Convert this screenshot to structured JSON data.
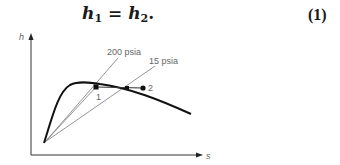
{
  "equation": {
    "lhs_var": "h",
    "lhs_sub": "1",
    "operator": "=",
    "rhs_var": "h",
    "rhs_sub": "2",
    "trailing": ".",
    "number": "(1)"
  },
  "diagram": {
    "y_axis_label": "h",
    "x_axis_label": "s",
    "isobar_high_label": "200 psia",
    "isobar_low_label": "15 psia",
    "state_1_label": "1",
    "state_2_label": "2",
    "colors": {
      "curve": "#111111",
      "thin_lines": "#777777",
      "axis": "#333333",
      "text": "#666666"
    }
  }
}
